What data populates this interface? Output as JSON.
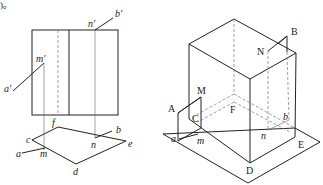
{
  "text_fragment": ")。",
  "left_figure": {
    "description": "Orthographic projections (front view and top view)",
    "front_view_labels": {
      "a_prime": "a′",
      "m_prime": "m′",
      "n_prime": "n′",
      "b_prime": "b′"
    },
    "top_view_labels": {
      "c": "c",
      "f": "f",
      "e": "e",
      "d": "d",
      "a": "a",
      "m": "m",
      "n": "n",
      "b": "b"
    }
  },
  "right_figure": {
    "description": "Isometric view of prism on ground plane",
    "labels": {
      "A": "A",
      "M": "M",
      "C": "C",
      "F": "F",
      "N": "N",
      "B": "B",
      "D": "D",
      "E": "E",
      "a": "a",
      "m": "m",
      "n": "n",
      "b": "b"
    }
  },
  "colors": {
    "line": "#222222",
    "hidden_line": "#777777",
    "background": "#ffffff"
  }
}
